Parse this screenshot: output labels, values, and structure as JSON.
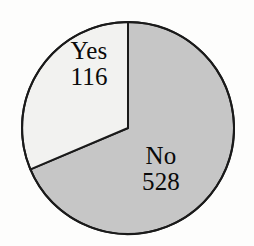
{
  "chart_data": {
    "type": "pie",
    "title": "",
    "categories": [
      "Yes",
      "No"
    ],
    "values": [
      116,
      528
    ],
    "total": 644,
    "legend": "none",
    "labels_inside": true,
    "slices": [
      {
        "name": "Yes",
        "value": 116,
        "value_text": "116",
        "percent": 18.0,
        "fill": "#f2f2f0",
        "stroke": "#1a1a1a",
        "start_angle_deg": 0,
        "end_angle_deg": -113,
        "direction": "counterclockwise"
      },
      {
        "name": "No",
        "value": 528,
        "value_text": "528",
        "percent": 82.0,
        "fill": "#c6c6c6",
        "stroke": "#1a1a1a",
        "start_angle_deg": 0,
        "end_angle_deg": 247,
        "direction": "clockwise"
      }
    ],
    "geometry": {
      "center_x": 128,
      "center_y": 128,
      "radius": 106
    }
  },
  "colors": {
    "background": "#fdfdfc",
    "slice_yes": "#f2f2f0",
    "slice_no": "#c6c6c6",
    "outline": "#1a1a1a",
    "label_text": "#0a0a0a"
  }
}
